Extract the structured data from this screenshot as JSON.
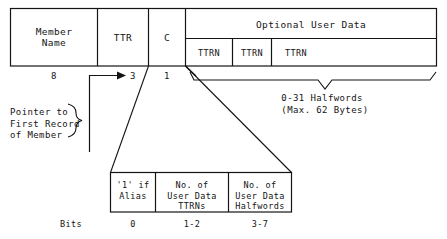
{
  "diagram": {
    "ink_color": "#141414",
    "background_color": "#ffffff",
    "main_record": {
      "fields": [
        {
          "label": "Member\nName",
          "size": "8"
        },
        {
          "label": "TTR",
          "size": "3"
        },
        {
          "label": "C",
          "size": "1"
        },
        {
          "label": "Optional User Data",
          "size": ""
        }
      ],
      "user_data_subcells": [
        "TTRN",
        "TTRN",
        "TTRN"
      ]
    },
    "annotations": {
      "pointer_note": "Pointer to\nFirst Record\nof Member",
      "halfwords_note": "0-31 Halfwords\n(Max. 62 Bytes)"
    },
    "c_byte_detail": {
      "cells": [
        {
          "label": "'1' if\nAlias",
          "bits": "0"
        },
        {
          "label": "No. of\nUser Data\nTTRNs",
          "bits": "1-2"
        },
        {
          "label": "No. of\nUser Data\nHalfwords",
          "bits": "3-7"
        }
      ],
      "bits_axis_label": "Bits"
    }
  }
}
